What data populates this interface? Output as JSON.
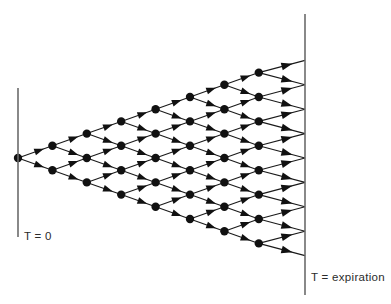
{
  "figure": {
    "type": "binomial-tree",
    "background_color": "#ffffff",
    "node_color": "#111111",
    "branch_color": "#1a1a1a",
    "axis_color": "#6b6b6b"
  },
  "labels": {
    "start_axis": "T = 0",
    "end_axis": "T = expiration"
  },
  "chart_data": {
    "type": "diagram",
    "subtype": "binomial-lattice",
    "steps": 8,
    "root": {
      "x": 18,
      "y": 158
    },
    "column_spacing_px": 34.4,
    "vertical_step_px": 24.4,
    "node_radius_px": 4.2,
    "columns": [
      {
        "index": 0,
        "x": 18.0,
        "node_count": 1,
        "terminal": false
      },
      {
        "index": 1,
        "x": 52.4,
        "node_count": 2,
        "terminal": false
      },
      {
        "index": 2,
        "x": 86.8,
        "node_count": 3,
        "terminal": false
      },
      {
        "index": 3,
        "x": 121.2,
        "node_count": 4,
        "terminal": false
      },
      {
        "index": 4,
        "x": 155.6,
        "node_count": 5,
        "terminal": false
      },
      {
        "index": 5,
        "x": 190.0,
        "node_count": 6,
        "terminal": false
      },
      {
        "index": 6,
        "x": 224.4,
        "node_count": 7,
        "terminal": false
      },
      {
        "index": 7,
        "x": 258.8,
        "node_count": 8,
        "terminal": false
      },
      {
        "index": 8,
        "x": 305.0,
        "node_count": 9,
        "terminal": true
      }
    ],
    "axes": [
      {
        "name": "start",
        "x": 18,
        "y_top": 88,
        "y_bottom": 237,
        "label": "T = 0"
      },
      {
        "name": "expiration",
        "x": 305,
        "y_top": 14,
        "y_bottom": 295,
        "label": "T = expiration"
      }
    ],
    "label_positions": [
      {
        "text": "T = 0",
        "x": 24,
        "y": 240
      },
      {
        "text": "T = expiration",
        "x": 311,
        "y": 281
      }
    ]
  }
}
